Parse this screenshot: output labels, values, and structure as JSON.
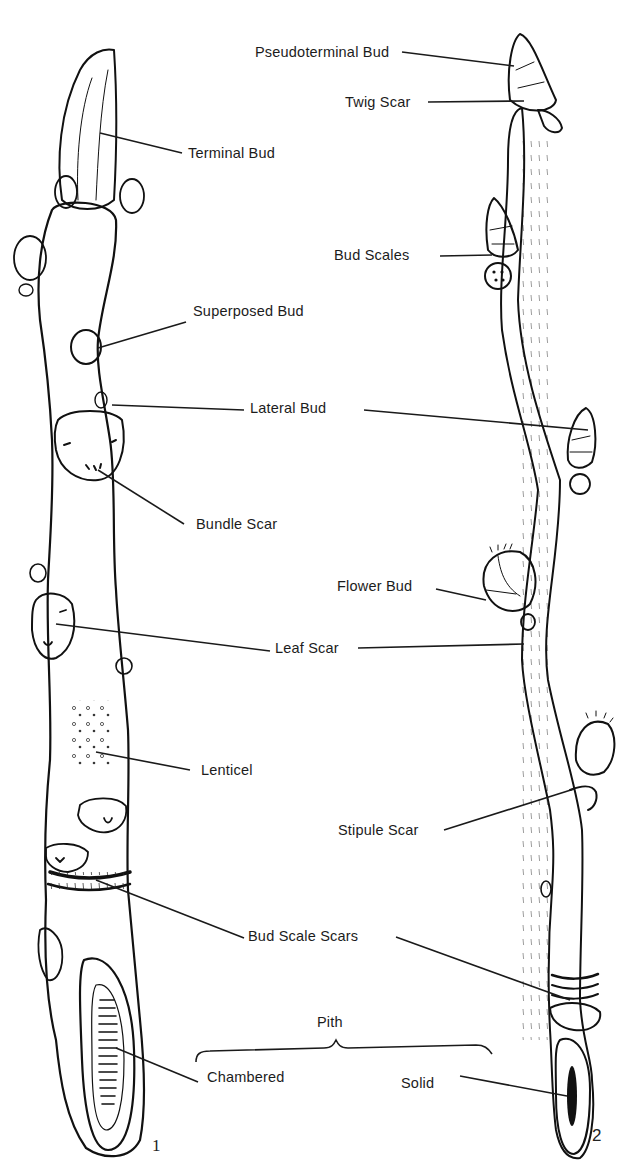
{
  "figure": {
    "panels": [
      {
        "number": "1",
        "description": "Stout twig with terminal bud and chambered pith"
      },
      {
        "number": "2",
        "description": "Slender twig with pseudoterminal bud and solid pith"
      }
    ]
  },
  "labels": {
    "pseudoterminal_bud": "Pseudoterminal Bud",
    "twig_scar": "Twig Scar",
    "terminal_bud": "Terminal Bud",
    "bud_scales": "Bud Scales",
    "superposed_bud": "Superposed Bud",
    "lateral_bud": "Lateral Bud",
    "bundle_scar": "Bundle Scar",
    "flower_bud": "Flower Bud",
    "leaf_scar": "Leaf Scar",
    "lenticel": "Lenticel",
    "stipule_scar": "Stipule Scar",
    "bud_scale_scars": "Bud Scale Scars",
    "pith": "Pith",
    "chambered": "Chambered",
    "solid": "Solid"
  },
  "panel_numbers": {
    "left": "1",
    "right": "2"
  },
  "colors": {
    "ink": "#111111",
    "paper": "#ffffff"
  }
}
